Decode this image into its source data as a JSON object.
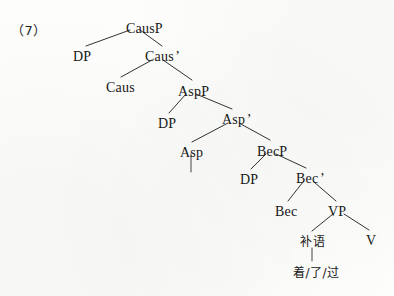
{
  "figure": {
    "example_number": "（7）",
    "type": "syntactic-tree",
    "ink_color": "#171717",
    "background_color": "#fdfdfc"
  },
  "tree": {
    "nodes": [
      {
        "id": "causp",
        "label": "CausP",
        "x": 126,
        "y": 22,
        "cjk": false
      },
      {
        "id": "dp1",
        "label": "DP",
        "x": 73,
        "y": 50,
        "cjk": false
      },
      {
        "id": "causbar",
        "label": "Caus",
        "prime": "’",
        "x": 145,
        "y": 50,
        "cjk": false
      },
      {
        "id": "caus",
        "label": "Caus",
        "x": 106,
        "y": 81,
        "cjk": false
      },
      {
        "id": "aspp",
        "label": "AspP",
        "x": 178,
        "y": 85,
        "cjk": false
      },
      {
        "id": "dp2",
        "label": "DP",
        "x": 158,
        "y": 117,
        "cjk": false
      },
      {
        "id": "aspbar",
        "label": "Asp",
        "prime": "’",
        "x": 222,
        "y": 113,
        "cjk": false
      },
      {
        "id": "asp",
        "label": "Asp",
        "x": 180,
        "y": 146,
        "cjk": false
      },
      {
        "id": "becp",
        "label": "BecP",
        "x": 257,
        "y": 145,
        "cjk": false
      },
      {
        "id": "dp3",
        "label": "DP",
        "x": 240,
        "y": 173,
        "cjk": false
      },
      {
        "id": "becbar",
        "label": "Bec",
        "prime": "’",
        "x": 296,
        "y": 172,
        "cjk": false
      },
      {
        "id": "bec",
        "label": "Bec",
        "x": 275,
        "y": 205,
        "cjk": false
      },
      {
        "id": "vp",
        "label": "VP",
        "x": 328,
        "y": 205,
        "cjk": false
      },
      {
        "id": "buyu",
        "label": "补语",
        "x": 300,
        "y": 236,
        "cjk": true
      },
      {
        "id": "v",
        "label": "V",
        "x": 366,
        "y": 234,
        "cjk": false
      },
      {
        "id": "aspect",
        "label": "着/了/过",
        "x": 293,
        "y": 267,
        "cjk": true
      }
    ],
    "branches": [
      {
        "from": "causp",
        "to": "dp1",
        "x1": 130,
        "y1": 30,
        "x2": 86,
        "y2": 46
      },
      {
        "from": "causp",
        "to": "causbar",
        "x1": 140,
        "y1": 30,
        "x2": 162,
        "y2": 46
      },
      {
        "from": "causbar",
        "to": "caus",
        "x1": 152,
        "y1": 60,
        "x2": 121,
        "y2": 77
      },
      {
        "from": "causbar",
        "to": "aspp",
        "x1": 163,
        "y1": 60,
        "x2": 192,
        "y2": 80
      },
      {
        "from": "aspp",
        "to": "dp2",
        "x1": 186,
        "y1": 94,
        "x2": 169,
        "y2": 113
      },
      {
        "from": "aspp",
        "to": "aspbar",
        "x1": 196,
        "y1": 94,
        "x2": 232,
        "y2": 109
      },
      {
        "from": "aspbar",
        "to": "asp",
        "x1": 228,
        "y1": 123,
        "x2": 192,
        "y2": 142
      },
      {
        "from": "aspbar",
        "to": "becp",
        "x1": 239,
        "y1": 123,
        "x2": 270,
        "y2": 140
      },
      {
        "from": "asp",
        "to": "asp-empty",
        "x1": 191,
        "y1": 154,
        "x2": 191,
        "y2": 172,
        "stem": true
      },
      {
        "from": "becp",
        "to": "dp3",
        "x1": 266,
        "y1": 154,
        "x2": 251,
        "y2": 169
      },
      {
        "from": "becp",
        "to": "becbar",
        "x1": 276,
        "y1": 154,
        "x2": 306,
        "y2": 168
      },
      {
        "from": "becbar",
        "to": "bec",
        "x1": 303,
        "y1": 182,
        "x2": 288,
        "y2": 201
      },
      {
        "from": "becbar",
        "to": "vp",
        "x1": 314,
        "y1": 182,
        "x2": 336,
        "y2": 201
      },
      {
        "from": "vp",
        "to": "buyu",
        "x1": 333,
        "y1": 214,
        "x2": 312,
        "y2": 231
      },
      {
        "from": "vp",
        "to": "v",
        "x1": 344,
        "y1": 214,
        "x2": 369,
        "y2": 230
      },
      {
        "from": "buyu",
        "to": "aspect",
        "x1": 312,
        "y1": 248,
        "x2": 312,
        "y2": 261,
        "stem": true
      }
    ]
  }
}
